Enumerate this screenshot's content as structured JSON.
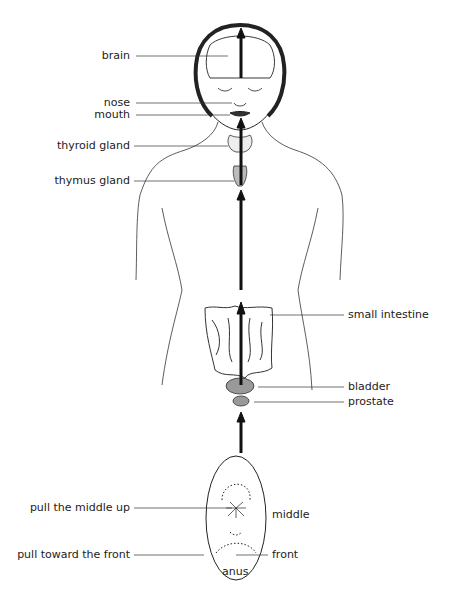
{
  "diagram": {
    "title": "",
    "labels_left": {
      "brain": "brain",
      "nose": "nose",
      "mouth": "mouth",
      "thyroid": "thyroid gland",
      "thymus": "thymus gland",
      "pull_middle": "pull the middle up",
      "pull_front": "pull toward the front"
    },
    "labels_right": {
      "small_intestine": "small intestine",
      "bladder": "bladder",
      "prostate": "prostate",
      "middle": "middle",
      "front": "front"
    },
    "labels_bottom": {
      "anus": "anus"
    },
    "colors": {
      "line": "#222222",
      "arrow": "#111111",
      "background": "#ffffff"
    }
  }
}
